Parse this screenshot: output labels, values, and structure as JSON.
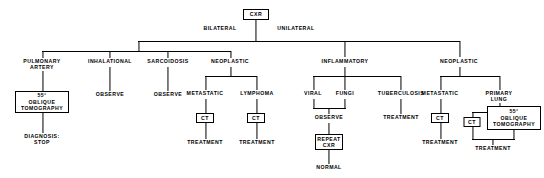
{
  "diagram": {
    "root": {
      "label": "CXR",
      "shape": "box"
    },
    "branch_labels": {
      "left": "BILATERAL",
      "right": "UNILATERAL"
    },
    "nodes": {
      "pulmonary_artery": "PULMONARY\nARTERY",
      "inhalational": "INHALATIONAL",
      "sarcoidosis": "SARCOIDOSIS",
      "neoplastic_left": "NEOPLASTIC",
      "inflammatory": "INFLAMMATORY",
      "neoplastic_right": "NEOPLASTIC",
      "oblique_tomography_left": "55°\nOBLIQUE\nTOMOGRAPHY",
      "diagnosis_stop": "DIAGNOSIS:\nSTOP",
      "observe_inhalational": "OBSERVE",
      "observe_sarcoidosis": "OBSERVE",
      "metastatic_left": "METASTATIC",
      "lymphoma": "LYMPHOMA",
      "ct_metastatic_left": "CT",
      "ct_lymphoma": "CT",
      "treatment_metastatic_left": "TREATMENT",
      "treatment_lymphoma": "TREATMENT",
      "viral": "VIRAL",
      "fungi": "FUNGI",
      "tuberculosis": "TUBERCULOSIS",
      "observe_infect": "OBSERVE",
      "repeat_cxr": "REPEAT\nCXR",
      "normal": "NORMAL",
      "treatment_tuberculosis": "TREATMENT",
      "metastatic_right": "METASTATIC",
      "primary_lung": "PRIMARY\nLUNG",
      "ct_metastatic_right": "CT",
      "treatment_metastatic_right": "TREATMENT",
      "ct_primary_lung": "CT",
      "oblique_tomography_right": "55°\nOBLIQUE\nTOMOGRAPHY",
      "treatment_primary_lung": "TREATMENT"
    },
    "colors": {
      "ink": "#000000",
      "paper": "#ffffff"
    }
  }
}
